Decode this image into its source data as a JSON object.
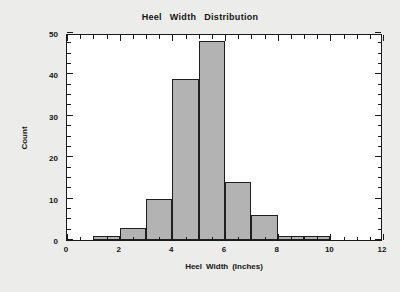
{
  "chart_data": {
    "type": "bar",
    "title_words": [
      "Heel",
      "Width",
      "Distribution"
    ],
    "xlabel": "Heel  Width  (Inches)",
    "xlabel_words": [
      "Heel",
      "Width",
      "(Inches)"
    ],
    "ylabel": "Count",
    "xlim": [
      0,
      12
    ],
    "ylim": [
      0,
      50
    ],
    "grid": false,
    "legend": null,
    "bin_width": 1,
    "bin_edges": [
      1,
      2,
      3,
      4,
      5,
      6,
      7,
      8,
      9,
      10,
      11
    ],
    "categories": [
      "1-2",
      "2-3",
      "3-4",
      "4-5",
      "5-6",
      "6-7",
      "7-8",
      "8-9",
      "9-10",
      "10-11"
    ],
    "values": [
      1,
      3,
      10,
      39,
      48,
      14,
      6,
      1,
      1,
      0
    ],
    "bars": [
      {
        "left": 1,
        "right": 2,
        "value": 1
      },
      {
        "left": 2,
        "right": 3,
        "value": 3
      },
      {
        "left": 3,
        "right": 4,
        "value": 10
      },
      {
        "left": 4,
        "right": 5,
        "value": 39
      },
      {
        "left": 5,
        "right": 6,
        "value": 48
      },
      {
        "left": 6,
        "right": 7,
        "value": 14
      },
      {
        "left": 7,
        "right": 8,
        "value": 6
      },
      {
        "left": 8,
        "right": 9,
        "value": 1
      },
      {
        "left": 9,
        "right": 10,
        "value": 1
      }
    ],
    "x_ticks": [
      0,
      2,
      4,
      6,
      8,
      10,
      12
    ],
    "x_tick_labels": [
      "0",
      "2",
      "4",
      "6",
      "8",
      "10",
      "12"
    ],
    "x_minor_step": 0.5,
    "y_ticks": [
      0,
      10,
      20,
      30,
      40,
      50
    ],
    "y_tick_labels": [
      "0",
      "10",
      "20",
      "30",
      "40",
      "50"
    ],
    "y_minor_step": 2.5,
    "colors": {
      "bar_fill": "#b3b3b3",
      "bar_edge": "#1f1f1f",
      "plot_background": "#ffffff",
      "page_background": "#ececeb",
      "axis": "#1a1a1a",
      "text": "#141414"
    }
  }
}
